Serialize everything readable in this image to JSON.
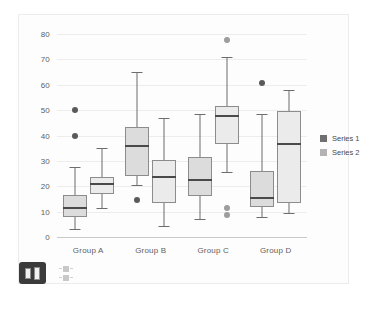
{
  "chart_data": {
    "type": "box",
    "title": "",
    "xlabel": "",
    "ylabel": "",
    "categories": [
      "Group A",
      "Group B",
      "Group C",
      "Group D"
    ],
    "yticks": [
      0,
      10,
      20,
      30,
      40,
      50,
      60,
      70,
      80
    ],
    "ylim": [
      0,
      80
    ],
    "grid": true,
    "legend_position": "right",
    "series": [
      {
        "name": "Series 1",
        "color": "#6f6f6f",
        "box_fill": "#dcdcdc",
        "boxes": [
          {
            "category": "Group A",
            "min": 3,
            "q1": 8,
            "median": 11.5,
            "q3": 16.5,
            "max": 27.5,
            "outliers": [
              50,
              40
            ]
          },
          {
            "category": "Group B",
            "min": 20.5,
            "q1": 24,
            "median": 36,
            "q3": 43.5,
            "max": 65,
            "outliers": [
              14.5
            ]
          },
          {
            "category": "Group C",
            "min": 7,
            "q1": 16,
            "median": 22.5,
            "q3": 31.5,
            "max": 48.5,
            "outliers": []
          },
          {
            "category": "Group D",
            "min": 8,
            "q1": 12,
            "median": 15.5,
            "q3": 26,
            "max": 48.5,
            "outliers": [
              60.5
            ]
          }
        ]
      },
      {
        "name": "Series 2",
        "color": "#b3b3b3",
        "box_fill": "#ebebeb",
        "boxes": [
          {
            "category": "Group A",
            "min": 11.5,
            "q1": 17,
            "median": 21,
            "q3": 23.5,
            "max": 35,
            "outliers": []
          },
          {
            "category": "Group B",
            "min": 4.5,
            "q1": 13.5,
            "median": 23.5,
            "q3": 30.5,
            "max": 47,
            "outliers": []
          },
          {
            "category": "Group C",
            "min": 25.5,
            "q1": 36.5,
            "median": 47.5,
            "q3": 51.5,
            "max": 71,
            "outliers": [
              77.5,
              11.5,
              8.5
            ]
          },
          {
            "category": "Group D",
            "min": 9.5,
            "q1": 13.5,
            "median": 36.5,
            "q3": 49.5,
            "max": 58,
            "outliers": []
          }
        ]
      }
    ]
  },
  "legend": {
    "items": [
      {
        "label": "Series 1"
      },
      {
        "label": "Series 2"
      }
    ]
  },
  "toolbar": {
    "chart_type_button_name": "bar-chart-icon",
    "mini_legend": [
      {
        "name": "series-1-marker"
      },
      {
        "name": "series-2-marker"
      }
    ]
  },
  "colors": {
    "background": "#ffffff",
    "card": "#fdfdfd",
    "card_border": "#ececec",
    "gridline": "#ededed",
    "axis": "#c9c9c9",
    "tick_text": "#5d5d5d",
    "series1": "#6f6f6f",
    "series2": "#b3b3b3",
    "median": "#4a4a4a",
    "toolbar_button": "#3b3b3b"
  }
}
